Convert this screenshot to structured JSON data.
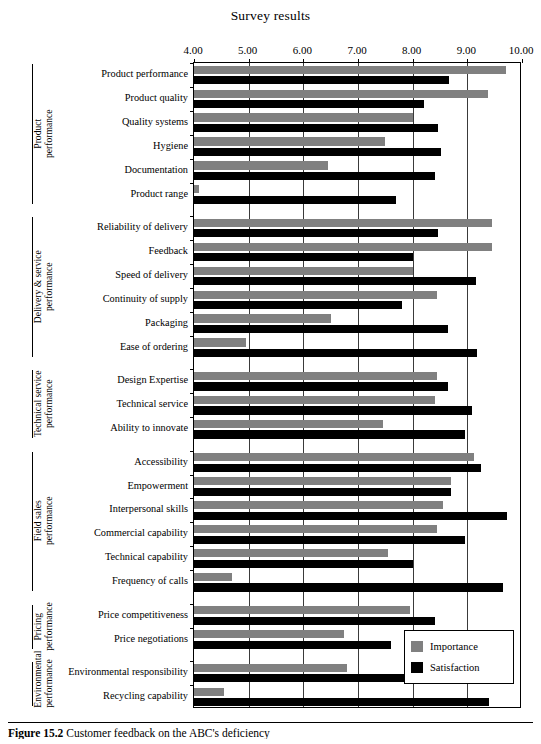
{
  "figure": {
    "title": "Survey results",
    "caption_label": "Figure 15.2",
    "caption_text": "Customer feedback on the ABC's deficiency"
  },
  "legend": {
    "position": "bottom-right",
    "entries": [
      {
        "label": "Importance",
        "color": "#808080"
      },
      {
        "label": "Satisfaction",
        "color": "#000000"
      }
    ]
  },
  "axis": {
    "ticks": [
      "4.00",
      "5.00",
      "6.00",
      "7.00",
      "8.00",
      "9.00",
      "10.00"
    ],
    "min": 4.0,
    "max": 10.0
  },
  "groups": [
    {
      "name": "Product\nperformance",
      "count": 6
    },
    {
      "name": "Delivery & service\nperformance",
      "count": 6
    },
    {
      "name": "Technical service\nperformance",
      "count": 3
    },
    {
      "name": "Field sales\nperformance",
      "count": 6
    },
    {
      "name": "Pricing\nperformance",
      "count": 2
    },
    {
      "name": "Environmental\nperformance",
      "count": 2
    }
  ],
  "chart_data": {
    "type": "bar",
    "orientation": "horizontal",
    "title": "Survey results",
    "xlabel": "",
    "ylabel": "",
    "xlim": [
      4.0,
      10.0
    ],
    "grid": true,
    "legend_position": "bottom-right",
    "categories": [
      "Product performance",
      "Product quality",
      "Quality systems",
      "Hygiene",
      "Documentation",
      "Product range",
      "Reliability of delivery",
      "Feedback",
      "Speed of delivery",
      "Continuity of supply",
      "Packaging",
      "Ease of ordering",
      "Design Expertise",
      "Technical service",
      "Ability to innovate",
      "Accessibility",
      "Empowerment",
      "Interpersonal skills",
      "Commercial capability",
      "Technical capability",
      "Frequency of calls",
      "Price competitiveness",
      "Price negotiations",
      "Environmental responsibility",
      "Recycling capability"
    ],
    "series": [
      {
        "name": "Importance",
        "color": "#808080",
        "values": [
          9.7,
          9.37,
          8.0,
          7.5,
          6.45,
          4.1,
          9.45,
          9.45,
          8.0,
          8.45,
          6.5,
          4.95,
          8.45,
          8.4,
          7.45,
          9.13,
          8.7,
          8.55,
          8.45,
          7.55,
          4.7,
          7.95,
          6.75,
          6.8,
          4.55
        ]
      },
      {
        "name": "Satisfaction",
        "color": "#000000",
        "values": [
          8.67,
          8.2,
          8.47,
          8.52,
          8.4,
          7.7,
          8.47,
          8.0,
          9.15,
          7.8,
          8.65,
          9.18,
          8.65,
          9.08,
          8.95,
          9.25,
          8.7,
          9.72,
          8.95,
          8.0,
          9.65,
          8.4,
          7.6,
          9.5,
          9.4
        ]
      }
    ]
  }
}
